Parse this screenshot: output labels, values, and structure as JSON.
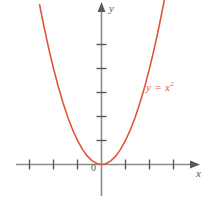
{
  "figure": {
    "name": "parabola-plot",
    "background_color": "#ffffff"
  },
  "axes": {
    "color": "#8c8c8e",
    "origin_label": "0",
    "x_label": "x",
    "y_label": "y",
    "x_axis_name": "x-axis",
    "y_axis_name": "y-axis",
    "x_arrow_name": "x-axis-arrow-icon",
    "y_arrow_name": "y-axis-arrow-icon"
  },
  "curve": {
    "label_text": "y = x",
    "label_exponent": "2",
    "color": "#e0553f",
    "stroke_width": 1.6
  },
  "chart_data": {
    "type": "line",
    "title": "",
    "xlabel": "x",
    "ylabel": "y",
    "function": "y = x^2",
    "grid": false,
    "legend": "none",
    "annotations": [
      {
        "text": "y = x²",
        "x": 2.3,
        "y": 3.3
      },
      {
        "text": "0",
        "x": -0.25,
        "y": -0.35
      }
    ],
    "xlim": [
      -3.5,
      4.0
    ],
    "ylim": [
      -0.7,
      6.9
    ],
    "xticks": [
      -3,
      -2,
      -1,
      1,
      2,
      3
    ],
    "yticks": [
      1,
      2,
      3,
      4,
      5
    ],
    "xticklabels": [
      "",
      "",
      "",
      "",
      "",
      ""
    ],
    "yticklabels": [
      "",
      "",
      "",
      "",
      ""
    ],
    "series": [
      {
        "name": "y = x^2",
        "color": "#e0553f",
        "x": [
          -2.58,
          -2.4,
          -2.2,
          -2.0,
          -1.8,
          -1.6,
          -1.4,
          -1.2,
          -1.0,
          -0.8,
          -0.6,
          -0.4,
          -0.2,
          0.0,
          0.2,
          0.4,
          0.6,
          0.8,
          1.0,
          1.2,
          1.4,
          1.6,
          1.8,
          2.0,
          2.2,
          2.4,
          2.6,
          2.65
        ],
        "y": [
          6.66,
          5.76,
          4.84,
          4.0,
          3.24,
          2.56,
          1.96,
          1.44,
          1.0,
          0.64,
          0.36,
          0.16,
          0.04,
          0.0,
          0.04,
          0.16,
          0.36,
          0.64,
          1.0,
          1.44,
          1.96,
          2.56,
          3.24,
          4.0,
          4.84,
          5.76,
          6.76,
          7.02
        ]
      }
    ]
  }
}
